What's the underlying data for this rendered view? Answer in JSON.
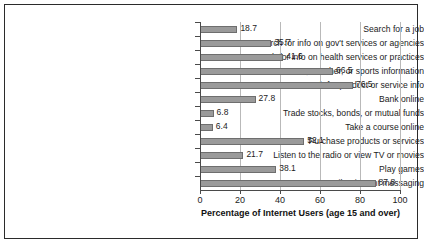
{
  "chart_data": {
    "type": "bar",
    "orientation": "horizontal",
    "title": "",
    "xlabel": "Percentage of Internet Users (age 15 and over)",
    "ylabel": "",
    "xlim": [
      0,
      100
    ],
    "xticks": [
      0,
      20,
      40,
      60,
      80,
      100
    ],
    "grid": true,
    "legend": null,
    "bar_color": "#9a9a9a",
    "bar_edge_color": "#6e6e6e",
    "categories": [
      "Search for a job",
      "Search for info on gov't services or agencies",
      "Search for info on health services or practices",
      "Get news, weather, or sports information",
      "Search for product or service info",
      "Bank online",
      "Trade stocks, bonds, or mutual funds",
      "Take a course online",
      "Purchase products or services",
      "Listen to the radio or view TV or movies",
      "Play games",
      "E-mail or instant messaging"
    ],
    "values": [
      18.7,
      35.7,
      41.6,
      66.5,
      76.5,
      27.8,
      6.8,
      6.4,
      52.1,
      21.7,
      38.1,
      87.8
    ],
    "value_labels": [
      "18.7",
      "35.7",
      "41.6",
      "66.5",
      "76.5",
      "27.8",
      "6.8",
      "6.4",
      "52.1",
      "21.7",
      "38.1",
      "87.8"
    ]
  }
}
